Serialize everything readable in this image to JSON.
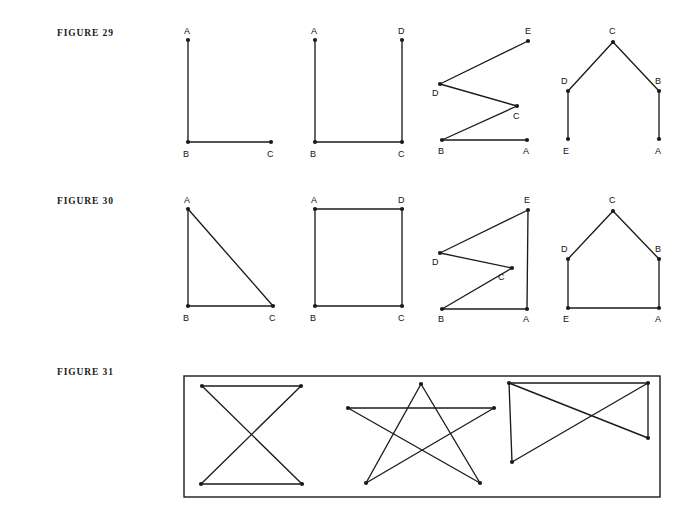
{
  "page": {
    "width": 691,
    "height": 527,
    "background": "#ffffff",
    "ink_color": "#1b1b1b"
  },
  "figures": [
    {
      "id": "figure-29",
      "label": "FIGURE 29",
      "label_pos": {
        "x": 57,
        "y": 28
      },
      "panels": [
        {
          "id": "fig29-panel-1",
          "name": "right-angle-path-a-b-c",
          "vertices": [
            {
              "name": "A",
              "x": 188,
              "y": 40,
              "lx": 184,
              "ly": 34
            },
            {
              "name": "B",
              "x": 188,
              "y": 142,
              "lx": 183,
              "ly": 157
            },
            {
              "name": "C",
              "x": 271,
              "y": 142,
              "lx": 267,
              "ly": 157
            }
          ],
          "edges": [
            [
              "A",
              "B"
            ],
            [
              "B",
              "C"
            ]
          ]
        },
        {
          "id": "fig29-panel-2",
          "name": "open-square-path-a-b-c-d",
          "vertices": [
            {
              "name": "A",
              "x": 315,
              "y": 40,
              "lx": 311,
              "ly": 34
            },
            {
              "name": "B",
              "x": 315,
              "y": 142,
              "lx": 310,
              "ly": 157
            },
            {
              "name": "C",
              "x": 402,
              "y": 142,
              "lx": 398,
              "ly": 157
            },
            {
              "name": "D",
              "x": 402,
              "y": 40,
              "lx": 398,
              "ly": 34
            }
          ],
          "edges": [
            [
              "A",
              "B"
            ],
            [
              "B",
              "C"
            ],
            [
              "C",
              "D"
            ]
          ]
        },
        {
          "id": "fig29-panel-3",
          "name": "zigzag-path-e-d-c-b-a",
          "vertices": [
            {
              "name": "E",
              "x": 528,
              "y": 41,
              "lx": 525,
              "ly": 34
            },
            {
              "name": "D",
              "x": 440,
              "y": 84,
              "lx": 432,
              "ly": 96
            },
            {
              "name": "C",
              "x": 517,
              "y": 106,
              "lx": 513,
              "ly": 119
            },
            {
              "name": "B",
              "x": 442,
              "y": 140,
              "lx": 438,
              "ly": 154
            },
            {
              "name": "A",
              "x": 527,
              "y": 140,
              "lx": 523,
              "ly": 154
            }
          ],
          "edges": [
            [
              "E",
              "D"
            ],
            [
              "D",
              "C"
            ],
            [
              "C",
              "B"
            ],
            [
              "B",
              "A"
            ]
          ]
        },
        {
          "id": "fig29-panel-4",
          "name": "roof-path-e-d-c-b-a",
          "vertices": [
            {
              "name": "C",
              "x": 613,
              "y": 42,
              "lx": 609,
              "ly": 34
            },
            {
              "name": "D",
              "x": 568,
              "y": 91,
              "lx": 561,
              "ly": 84
            },
            {
              "name": "B",
              "x": 659,
              "y": 91,
              "lx": 655,
              "ly": 84
            },
            {
              "name": "E",
              "x": 568,
              "y": 139,
              "lx": 563,
              "ly": 154
            },
            {
              "name": "A",
              "x": 659,
              "y": 139,
              "lx": 655,
              "ly": 154
            }
          ],
          "edges": [
            [
              "E",
              "D"
            ],
            [
              "D",
              "C"
            ],
            [
              "C",
              "B"
            ],
            [
              "B",
              "A"
            ]
          ]
        }
      ]
    },
    {
      "id": "figure-30",
      "label": "FIGURE 30",
      "label_pos": {
        "x": 57,
        "y": 196
      },
      "panels": [
        {
          "id": "fig30-panel-1",
          "name": "closed-triangle-a-b-c",
          "vertices": [
            {
              "name": "A",
              "x": 188,
              "y": 209,
              "lx": 184,
              "ly": 203
            },
            {
              "name": "B",
              "x": 188,
              "y": 306,
              "lx": 183,
              "ly": 321
            },
            {
              "name": "C",
              "x": 273,
              "y": 306,
              "lx": 269,
              "ly": 321
            }
          ],
          "edges": [
            [
              "A",
              "B"
            ],
            [
              "B",
              "C"
            ],
            [
              "C",
              "A"
            ]
          ]
        },
        {
          "id": "fig30-panel-2",
          "name": "closed-square-a-b-c-d",
          "vertices": [
            {
              "name": "A",
              "x": 315,
              "y": 209,
              "lx": 311,
              "ly": 203
            },
            {
              "name": "B",
              "x": 315,
              "y": 306,
              "lx": 310,
              "ly": 321
            },
            {
              "name": "C",
              "x": 402,
              "y": 306,
              "lx": 398,
              "ly": 321
            },
            {
              "name": "D",
              "x": 402,
              "y": 209,
              "lx": 398,
              "ly": 203
            }
          ],
          "edges": [
            [
              "A",
              "B"
            ],
            [
              "B",
              "C"
            ],
            [
              "C",
              "D"
            ],
            [
              "D",
              "A"
            ]
          ]
        },
        {
          "id": "fig30-panel-3",
          "name": "closed-zigzag-e-d-c-b-a",
          "vertices": [
            {
              "name": "E",
              "x": 528,
              "y": 210,
              "lx": 524,
              "ly": 203
            },
            {
              "name": "D",
              "x": 440,
              "y": 253,
              "lx": 432,
              "ly": 265
            },
            {
              "name": "C",
              "x": 512,
              "y": 268,
              "lx": 498,
              "ly": 280
            },
            {
              "name": "B",
              "x": 442,
              "y": 309,
              "lx": 438,
              "ly": 322
            },
            {
              "name": "A",
              "x": 527,
              "y": 309,
              "lx": 523,
              "ly": 322
            }
          ],
          "edges": [
            [
              "E",
              "D"
            ],
            [
              "D",
              "C"
            ],
            [
              "C",
              "B"
            ],
            [
              "B",
              "A"
            ],
            [
              "A",
              "E"
            ]
          ]
        },
        {
          "id": "fig30-panel-4",
          "name": "closed-house-e-d-c-b-a",
          "vertices": [
            {
              "name": "C",
              "x": 613,
              "y": 211,
              "lx": 609,
              "ly": 203
            },
            {
              "name": "D",
              "x": 568,
              "y": 259,
              "lx": 561,
              "ly": 252
            },
            {
              "name": "B",
              "x": 659,
              "y": 259,
              "lx": 655,
              "ly": 252
            },
            {
              "name": "E",
              "x": 568,
              "y": 308,
              "lx": 563,
              "ly": 322
            },
            {
              "name": "A",
              "x": 659,
              "y": 308,
              "lx": 655,
              "ly": 322
            }
          ],
          "edges": [
            [
              "E",
              "D"
            ],
            [
              "D",
              "C"
            ],
            [
              "C",
              "B"
            ],
            [
              "B",
              "A"
            ],
            [
              "A",
              "E"
            ]
          ]
        }
      ]
    },
    {
      "id": "figure-31",
      "label": "FIGURE 31",
      "label_pos": {
        "x": 57,
        "y": 367
      },
      "box": {
        "x": 184,
        "y": 376,
        "width": 476,
        "height": 121
      },
      "panels": [
        {
          "id": "fig31-panel-1",
          "name": "bowtie-graph",
          "vertices": [
            {
              "name": "TL",
              "x": 202,
              "y": 386
            },
            {
              "name": "TR",
              "x": 301,
              "y": 386
            },
            {
              "name": "BL",
              "x": 201,
              "y": 484
            },
            {
              "name": "BR",
              "x": 302,
              "y": 484
            }
          ],
          "edges": [
            [
              "TL",
              "TR"
            ],
            [
              "TL",
              "BR"
            ],
            [
              "TR",
              "BL"
            ],
            [
              "BL",
              "BR"
            ]
          ]
        },
        {
          "id": "fig31-panel-2",
          "name": "pentagram-star-graph",
          "vertices": [
            {
              "name": "T",
              "x": 421,
              "y": 384
            },
            {
              "name": "L",
              "x": 348,
              "y": 408
            },
            {
              "name": "R",
              "x": 494,
              "y": 408
            },
            {
              "name": "BL",
              "x": 366,
              "y": 483
            },
            {
              "name": "BR",
              "x": 480,
              "y": 483
            }
          ],
          "edges": [
            [
              "T",
              "BL"
            ],
            [
              "BL",
              "R"
            ],
            [
              "R",
              "L"
            ],
            [
              "L",
              "BR"
            ],
            [
              "BR",
              "T"
            ]
          ]
        },
        {
          "id": "fig31-panel-3",
          "name": "quadrilateral-with-crossing-diagonals",
          "vertices": [
            {
              "name": "TL",
              "x": 509,
              "y": 383
            },
            {
              "name": "TR",
              "x": 648,
              "y": 383
            },
            {
              "name": "RM",
              "x": 648,
              "y": 438
            },
            {
              "name": "BL",
              "x": 512,
              "y": 462
            }
          ],
          "edges": [
            [
              "TL",
              "TR"
            ],
            [
              "TL",
              "BL"
            ],
            [
              "TL",
              "RM"
            ],
            [
              "TR",
              "BL"
            ],
            [
              "TR",
              "RM"
            ]
          ]
        }
      ]
    }
  ]
}
